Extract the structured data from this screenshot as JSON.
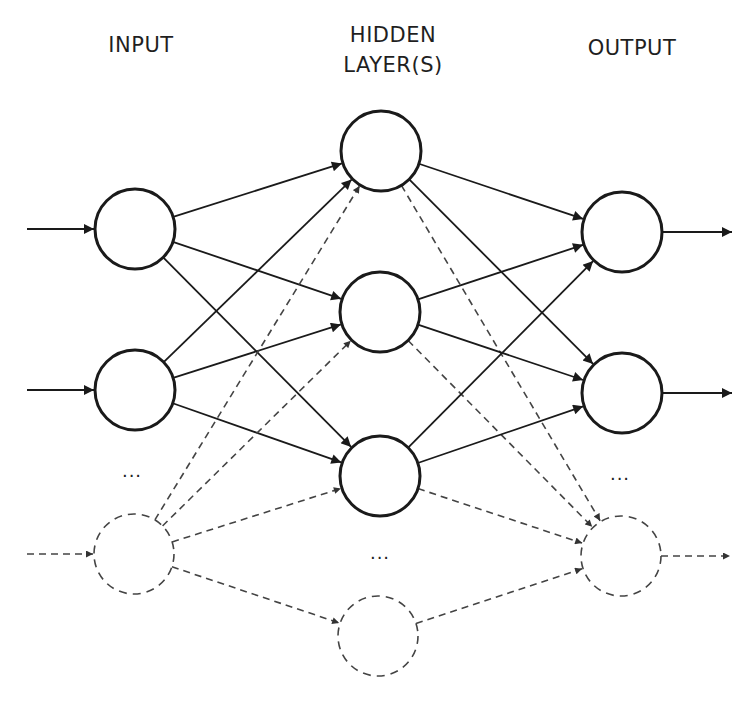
{
  "labels": {
    "input": "INPUT",
    "hidden_line1": "HIDDEN",
    "hidden_line2": "LAYER(S)",
    "output": "OUTPUT"
  },
  "ellipsis": "...",
  "colors": {
    "stroke": "#1a1a1a",
    "dashed_stroke": "#444444",
    "background": "#ffffff"
  },
  "layers": {
    "input": {
      "label": "INPUT",
      "nodes": [
        {
          "id": "i1",
          "cx": 135,
          "cy": 229,
          "dashed": false
        },
        {
          "id": "i2",
          "cx": 135,
          "cy": 390,
          "dashed": false
        },
        {
          "id": "in",
          "cx": 134,
          "cy": 554,
          "dashed": true
        }
      ],
      "ellipsis_pos": {
        "x": 132,
        "y": 474
      }
    },
    "hidden": {
      "label": "HIDDEN LAYER(S)",
      "nodes": [
        {
          "id": "h1",
          "cx": 381,
          "cy": 151,
          "dashed": false
        },
        {
          "id": "h2",
          "cx": 380,
          "cy": 312,
          "dashed": false
        },
        {
          "id": "h3",
          "cx": 380,
          "cy": 476,
          "dashed": false
        },
        {
          "id": "hn",
          "cx": 378,
          "cy": 636,
          "dashed": true
        }
      ],
      "ellipsis_pos": {
        "x": 380,
        "y": 556
      }
    },
    "output": {
      "label": "OUTPUT",
      "nodes": [
        {
          "id": "o1",
          "cx": 622,
          "cy": 232,
          "dashed": false
        },
        {
          "id": "o2",
          "cx": 622,
          "cy": 393,
          "dashed": false
        },
        {
          "id": "on",
          "cx": 621,
          "cy": 556,
          "dashed": true
        }
      ],
      "ellipsis_pos": {
        "x": 620,
        "y": 477
      }
    }
  },
  "node_radius": 40,
  "external_inputs": [
    {
      "to": "i1",
      "x1": 27,
      "dashed": false
    },
    {
      "to": "i2",
      "x1": 27,
      "dashed": false
    },
    {
      "to": "in",
      "x1": 27,
      "dashed": true
    }
  ],
  "external_outputs": [
    {
      "from": "o1",
      "x2": 732,
      "dashed": false
    },
    {
      "from": "o2",
      "x2": 732,
      "dashed": false
    },
    {
      "from": "on",
      "x2": 730,
      "dashed": true
    }
  ],
  "edges": [
    {
      "from": "i1",
      "to": "h1",
      "dashed": false
    },
    {
      "from": "i1",
      "to": "h2",
      "dashed": false
    },
    {
      "from": "i1",
      "to": "h3",
      "dashed": false
    },
    {
      "from": "i2",
      "to": "h1",
      "dashed": false
    },
    {
      "from": "i2",
      "to": "h2",
      "dashed": false
    },
    {
      "from": "i2",
      "to": "h3",
      "dashed": false
    },
    {
      "from": "in",
      "to": "h1",
      "dashed": true
    },
    {
      "from": "in",
      "to": "h2",
      "dashed": true
    },
    {
      "from": "in",
      "to": "h3",
      "dashed": true
    },
    {
      "from": "in",
      "to": "hn",
      "dashed": true
    },
    {
      "from": "h1",
      "to": "o1",
      "dashed": false
    },
    {
      "from": "h1",
      "to": "o2",
      "dashed": false
    },
    {
      "from": "h1",
      "to": "on",
      "dashed": true
    },
    {
      "from": "h2",
      "to": "o1",
      "dashed": false
    },
    {
      "from": "h2",
      "to": "o2",
      "dashed": false
    },
    {
      "from": "h2",
      "to": "on",
      "dashed": true
    },
    {
      "from": "h3",
      "to": "o1",
      "dashed": false
    },
    {
      "from": "h3",
      "to": "o2",
      "dashed": false
    },
    {
      "from": "h3",
      "to": "on",
      "dashed": true
    },
    {
      "from": "hn",
      "to": "on",
      "dashed": true
    }
  ]
}
